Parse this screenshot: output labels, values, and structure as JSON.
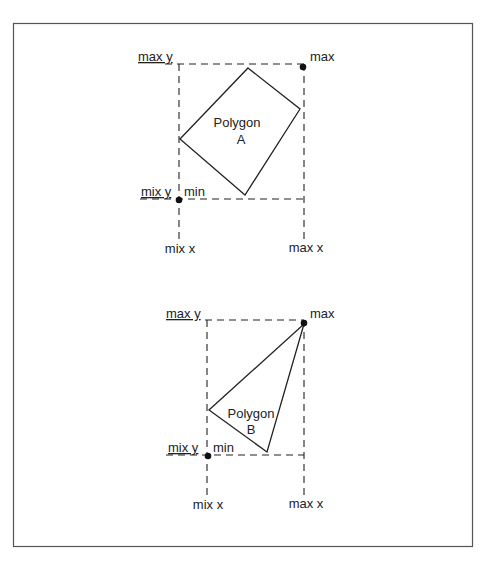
{
  "diagrams": [
    {
      "id": "A",
      "polygon_label_line1": "Polygon",
      "polygon_label_line2": "A",
      "max_y_label": "max y",
      "min_y_label": "mix y",
      "min_x_label": "mix x",
      "max_x_label": "max x",
      "max_point_label": "max",
      "min_point_label": "min"
    },
    {
      "id": "B",
      "polygon_label_line1": "Polygon",
      "polygon_label_line2": "B",
      "max_y_label": "max y",
      "min_y_label": "mix y",
      "min_x_label": "mix x",
      "max_x_label": "max x",
      "max_point_label": "max",
      "min_point_label": "min"
    }
  ],
  "colors": {
    "line": "#222222",
    "border": "#555555"
  }
}
